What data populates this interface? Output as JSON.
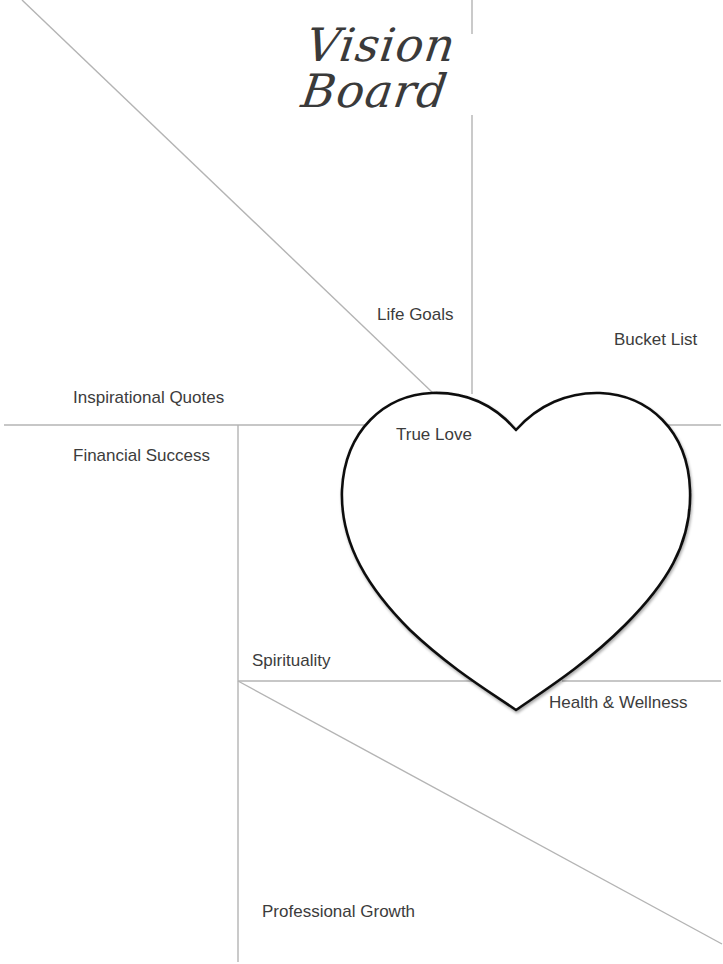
{
  "title": "Vision Board",
  "sections": {
    "life_goals": "Life Goals",
    "bucket_list": "Bucket List",
    "inspirational_quotes": "Inspirational Quotes",
    "true_love": "True Love",
    "financial_success": "Financial Success",
    "spirituality": "Spirituality",
    "health_wellness": "Health & Wellness",
    "professional_growth": "Professional Growth"
  },
  "colors": {
    "background": "#ffffff",
    "divider_lines": "#b4b4b4",
    "heart_outline": "#111111",
    "text": "#3c3c3c"
  }
}
